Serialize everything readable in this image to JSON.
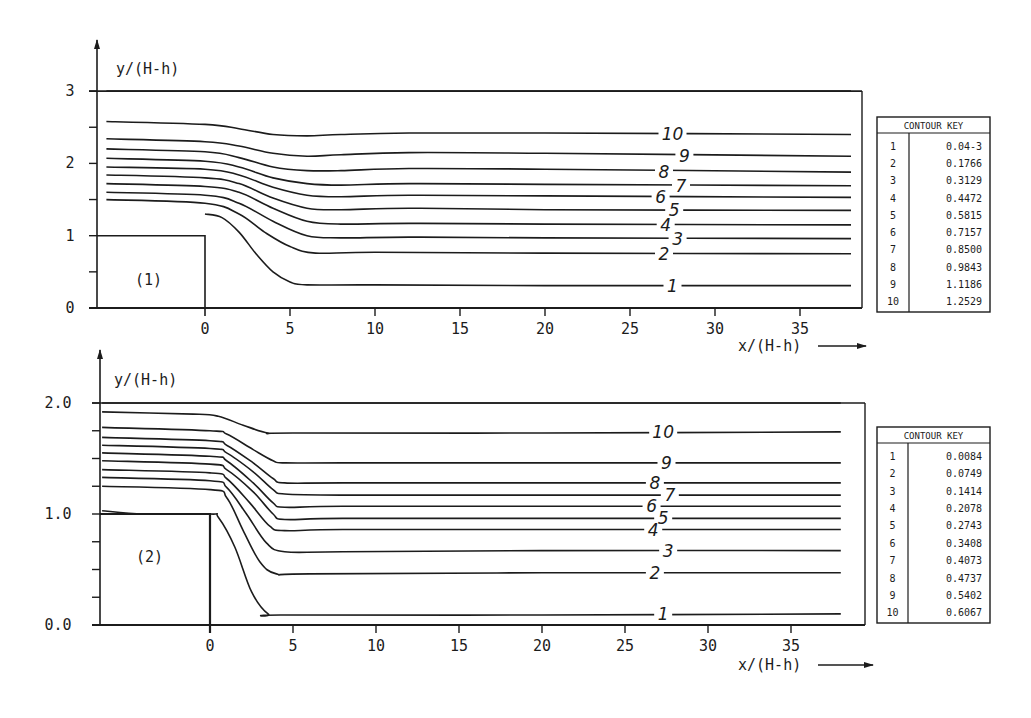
{
  "chart_data": [
    {
      "type": "line",
      "panel_id": "(1)",
      "title": "",
      "xlabel": "x/(H-h)",
      "ylabel": "y/(H-h)",
      "xlim": [
        -5.8,
        38
      ],
      "ylim": [
        0,
        3
      ],
      "x_ticks": [
        0,
        5,
        10,
        15,
        20,
        25,
        30,
        35
      ],
      "x_tick_labels": [
        "0",
        "5",
        "10",
        "15",
        "20",
        "25",
        "30",
        "35"
      ],
      "y_ticks": [
        0,
        0.5,
        1,
        1.5,
        2,
        2.5,
        3
      ],
      "y_tick_labels": [
        "0",
        "",
        "1",
        "",
        "2",
        "",
        "3"
      ],
      "step": {
        "x_end": 0,
        "height": 1.0
      },
      "legend": {
        "title": "CONTOUR KEY",
        "placement": "right",
        "entries": [
          {
            "id": "1",
            "value": "0.04-3"
          },
          {
            "id": "2",
            "value": "0.1766"
          },
          {
            "id": "3",
            "value": "0.3129"
          },
          {
            "id": "4",
            "value": "0.4472"
          },
          {
            "id": "5",
            "value": "0.5815"
          },
          {
            "id": "6",
            "value": "0.7157"
          },
          {
            "id": "7",
            "value": "0.8500"
          },
          {
            "id": "8",
            "value": "0.9843"
          },
          {
            "id": "9",
            "value": "1.1186"
          },
          {
            "id": "10",
            "value": "1.2529"
          }
        ]
      },
      "series": [
        {
          "name": "1",
          "label": "1",
          "label_x": 27.5,
          "points": [
            [
              0,
              1.3
            ],
            [
              1,
              1.25
            ],
            [
              2,
              1.05
            ],
            [
              3,
              0.75
            ],
            [
              4,
              0.5
            ],
            [
              5,
              0.36
            ],
            [
              6,
              0.32
            ],
            [
              10,
              0.32
            ],
            [
              20,
              0.31
            ],
            [
              38,
              0.31
            ]
          ]
        },
        {
          "name": "2",
          "label": "2",
          "label_x": 27.0,
          "points": [
            [
              -5.8,
              1.5
            ],
            [
              0,
              1.45
            ],
            [
              2,
              1.3
            ],
            [
              3.5,
              1.05
            ],
            [
              5,
              0.85
            ],
            [
              6.5,
              0.76
            ],
            [
              10,
              0.77
            ],
            [
              20,
              0.76
            ],
            [
              38,
              0.75
            ]
          ]
        },
        {
          "name": "3",
          "label": "3",
          "label_x": 27.8,
          "points": [
            [
              -5.8,
              1.6
            ],
            [
              0,
              1.56
            ],
            [
              2,
              1.45
            ],
            [
              4,
              1.2
            ],
            [
              6,
              1.0
            ],
            [
              8,
              0.97
            ],
            [
              12,
              0.98
            ],
            [
              20,
              0.97
            ],
            [
              38,
              0.96
            ]
          ]
        },
        {
          "name": "4",
          "label": "4",
          "label_x": 27.1,
          "points": [
            [
              -5.8,
              1.72
            ],
            [
              0,
              1.68
            ],
            [
              2,
              1.6
            ],
            [
              4,
              1.38
            ],
            [
              6,
              1.2
            ],
            [
              8,
              1.16
            ],
            [
              12,
              1.17
            ],
            [
              20,
              1.16
            ],
            [
              38,
              1.15
            ]
          ]
        },
        {
          "name": "5",
          "label": "5",
          "label_x": 27.6,
          "points": [
            [
              -5.8,
              1.84
            ],
            [
              0,
              1.8
            ],
            [
              2,
              1.72
            ],
            [
              4,
              1.52
            ],
            [
              6,
              1.38
            ],
            [
              8,
              1.36
            ],
            [
              12,
              1.38
            ],
            [
              20,
              1.36
            ],
            [
              38,
              1.35
            ]
          ]
        },
        {
          "name": "6",
          "label": "6",
          "label_x": 26.8,
          "points": [
            [
              -5.8,
              1.95
            ],
            [
              0,
              1.92
            ],
            [
              2,
              1.84
            ],
            [
              4,
              1.67
            ],
            [
              6,
              1.56
            ],
            [
              8,
              1.54
            ],
            [
              12,
              1.56
            ],
            [
              20,
              1.55
            ],
            [
              38,
              1.53
            ]
          ]
        },
        {
          "name": "7",
          "label": "7",
          "label_x": 28.0,
          "points": [
            [
              -5.8,
              2.07
            ],
            [
              0,
              2.03
            ],
            [
              2,
              1.95
            ],
            [
              4,
              1.8
            ],
            [
              6,
              1.72
            ],
            [
              8,
              1.7
            ],
            [
              12,
              1.72
            ],
            [
              20,
              1.71
            ],
            [
              38,
              1.69
            ]
          ]
        },
        {
          "name": "8",
          "label": "8",
          "label_x": 27.0,
          "points": [
            [
              -5.8,
              2.2
            ],
            [
              0,
              2.16
            ],
            [
              2,
              2.08
            ],
            [
              4,
              1.95
            ],
            [
              6,
              1.9
            ],
            [
              8,
              1.9
            ],
            [
              12,
              1.93
            ],
            [
              20,
              1.92
            ],
            [
              38,
              1.88
            ]
          ]
        },
        {
          "name": "9",
          "label": "9",
          "label_x": 28.2,
          "points": [
            [
              -5.8,
              2.34
            ],
            [
              0,
              2.3
            ],
            [
              2,
              2.24
            ],
            [
              4,
              2.14
            ],
            [
              6,
              2.1
            ],
            [
              8,
              2.12
            ],
            [
              12,
              2.15
            ],
            [
              20,
              2.14
            ],
            [
              38,
              2.1
            ]
          ]
        },
        {
          "name": "10",
          "label": "10",
          "label_x": 27.5,
          "points": [
            [
              -5.8,
              2.58
            ],
            [
              0,
              2.54
            ],
            [
              2,
              2.48
            ],
            [
              4,
              2.4
            ],
            [
              6,
              2.38
            ],
            [
              8,
              2.4
            ],
            [
              12,
              2.42
            ],
            [
              20,
              2.42
            ],
            [
              38,
              2.4
            ]
          ]
        },
        {
          "name": "top-boundary",
          "label": "",
          "points": [
            [
              -5.8,
              3.0
            ],
            [
              38,
              3.0
            ]
          ]
        }
      ]
    },
    {
      "type": "line",
      "panel_id": "(2)",
      "title": "",
      "xlabel": "x/(H-h)",
      "ylabel": "y/(H-h)",
      "xlim": [
        -6.5,
        38
      ],
      "ylim": [
        0,
        2.0
      ],
      "x_ticks": [
        0,
        5,
        10,
        15,
        20,
        25,
        30,
        35
      ],
      "x_tick_labels": [
        "0",
        "5",
        "10",
        "15",
        "20",
        "25",
        "30",
        "35"
      ],
      "y_ticks": [
        0,
        0.25,
        0.5,
        0.75,
        1.0,
        1.25,
        1.5,
        1.75,
        2.0
      ],
      "y_tick_labels": [
        "0.0",
        "",
        "",
        "",
        "1.0",
        "",
        "",
        "",
        "2.0"
      ],
      "step": {
        "x_end": 0,
        "height": 1.0
      },
      "legend": {
        "title": "CONTOUR KEY",
        "placement": "right",
        "entries": [
          {
            "id": "1",
            "value": "0.0084"
          },
          {
            "id": "2",
            "value": "0.0749"
          },
          {
            "id": "3",
            "value": "0.1414"
          },
          {
            "id": "4",
            "value": "0.2078"
          },
          {
            "id": "5",
            "value": "0.2743"
          },
          {
            "id": "6",
            "value": "0.3408"
          },
          {
            "id": "7",
            "value": "0.4073"
          },
          {
            "id": "8",
            "value": "0.4737"
          },
          {
            "id": "9",
            "value": "0.5402"
          },
          {
            "id": "10",
            "value": "0.6067"
          }
        ]
      },
      "series": [
        {
          "name": "1",
          "label": "1",
          "label_x": 27.3,
          "points": [
            [
              -6.5,
              1.03
            ],
            [
              -4,
              1.0
            ],
            [
              0,
              1.0
            ],
            [
              0.5,
              0.97
            ],
            [
              1.5,
              0.7
            ],
            [
              2.5,
              0.3
            ],
            [
              3.5,
              0.1
            ],
            [
              4.5,
              0.09
            ],
            [
              20,
              0.09
            ],
            [
              38,
              0.1
            ]
          ]
        },
        {
          "name": "2",
          "label": "2",
          "label_x": 26.8,
          "points": [
            [
              -6.5,
              1.25
            ],
            [
              0,
              1.22
            ],
            [
              1,
              1.15
            ],
            [
              2,
              0.85
            ],
            [
              3,
              0.57
            ],
            [
              4,
              0.46
            ],
            [
              6,
              0.46
            ],
            [
              20,
              0.47
            ],
            [
              38,
              0.47
            ]
          ]
        },
        {
          "name": "3",
          "label": "3",
          "label_x": 27.6,
          "points": [
            [
              -6.5,
              1.33
            ],
            [
              0,
              1.3
            ],
            [
              1,
              1.24
            ],
            [
              2.2,
              1.0
            ],
            [
              3.4,
              0.74
            ],
            [
              4.5,
              0.66
            ],
            [
              8,
              0.66
            ],
            [
              20,
              0.67
            ],
            [
              38,
              0.67
            ]
          ]
        },
        {
          "name": "4",
          "label": "4",
          "label_x": 26.7,
          "points": [
            [
              -6.5,
              1.4
            ],
            [
              0,
              1.37
            ],
            [
              1,
              1.32
            ],
            [
              2.4,
              1.1
            ],
            [
              3.6,
              0.89
            ],
            [
              4.5,
              0.85
            ],
            [
              8,
              0.86
            ],
            [
              20,
              0.86
            ],
            [
              38,
              0.86
            ]
          ]
        },
        {
          "name": "5",
          "label": "5",
          "label_x": 27.3,
          "points": [
            [
              -6.5,
              1.48
            ],
            [
              0,
              1.45
            ],
            [
              1,
              1.4
            ],
            [
              2.6,
              1.2
            ],
            [
              3.8,
              1.0
            ],
            [
              4.5,
              0.95
            ],
            [
              8,
              0.96
            ],
            [
              20,
              0.96
            ],
            [
              38,
              0.96
            ]
          ]
        },
        {
          "name": "6",
          "label": "6",
          "label_x": 26.6,
          "points": [
            [
              -6.5,
              1.55
            ],
            [
              0,
              1.52
            ],
            [
              1,
              1.48
            ],
            [
              2.6,
              1.28
            ],
            [
              3.8,
              1.1
            ],
            [
              4.5,
              1.06
            ],
            [
              8,
              1.07
            ],
            [
              20,
              1.07
            ],
            [
              38,
              1.07
            ]
          ]
        },
        {
          "name": "7",
          "label": "7",
          "label_x": 27.7,
          "points": [
            [
              -6.5,
              1.62
            ],
            [
              0,
              1.59
            ],
            [
              1,
              1.55
            ],
            [
              2.6,
              1.38
            ],
            [
              3.8,
              1.22
            ],
            [
              4.5,
              1.18
            ],
            [
              8,
              1.17
            ],
            [
              20,
              1.17
            ],
            [
              38,
              1.17
            ]
          ]
        },
        {
          "name": "8",
          "label": "8",
          "label_x": 26.8,
          "points": [
            [
              -6.5,
              1.69
            ],
            [
              0,
              1.66
            ],
            [
              1,
              1.62
            ],
            [
              2.6,
              1.46
            ],
            [
              3.8,
              1.32
            ],
            [
              4.5,
              1.28
            ],
            [
              8,
              1.28
            ],
            [
              20,
              1.28
            ],
            [
              38,
              1.28
            ]
          ]
        },
        {
          "name": "9",
          "label": "9",
          "label_x": 27.5,
          "points": [
            [
              -6.5,
              1.78
            ],
            [
              0,
              1.75
            ],
            [
              1,
              1.72
            ],
            [
              2.6,
              1.58
            ],
            [
              3.8,
              1.48
            ],
            [
              4.5,
              1.46
            ],
            [
              8,
              1.46
            ],
            [
              20,
              1.46
            ],
            [
              38,
              1.46
            ]
          ]
        },
        {
          "name": "10",
          "label": "10",
          "label_x": 27.3,
          "points": [
            [
              -6.5,
              1.92
            ],
            [
              -1,
              1.9
            ],
            [
              0.5,
              1.88
            ],
            [
              2,
              1.8
            ],
            [
              3.5,
              1.73
            ],
            [
              5,
              1.73
            ],
            [
              20,
              1.73
            ],
            [
              38,
              1.74
            ]
          ]
        },
        {
          "name": "top-boundary",
          "label": "",
          "points": [
            [
              -6.5,
              2.0
            ],
            [
              38,
              2.0
            ]
          ]
        }
      ]
    }
  ]
}
